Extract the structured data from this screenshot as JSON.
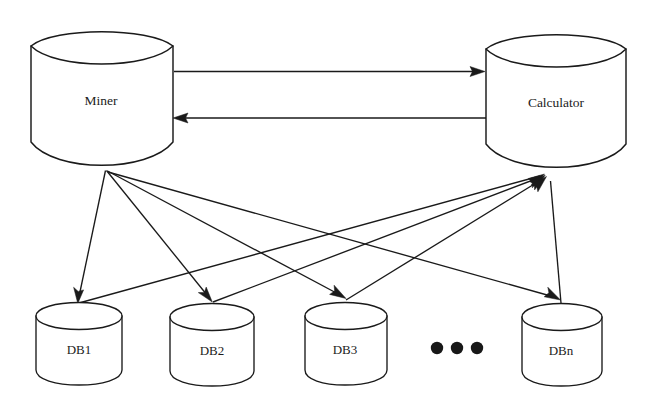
{
  "diagram": {
    "background_color": "#ffffff",
    "stroke_color": "#1a1a1a",
    "nodes": {
      "miner": {
        "label": "Miner",
        "type": "cylinder",
        "icon": "database-cylinder-icon"
      },
      "calculator": {
        "label": "Calculator",
        "type": "cylinder",
        "icon": "database-cylinder-icon"
      },
      "databases": [
        {
          "label": "DB1",
          "type": "cylinder",
          "icon": "database-cylinder-icon"
        },
        {
          "label": "DB2",
          "type": "cylinder",
          "icon": "database-cylinder-icon"
        },
        {
          "label": "DB3",
          "type": "cylinder",
          "icon": "database-cylinder-icon"
        },
        {
          "label": "DBn",
          "type": "cylinder",
          "icon": "database-cylinder-icon"
        }
      ]
    },
    "ellipsis": {
      "label": "● ● ●",
      "dot_count": 3,
      "meaning": "more databases"
    },
    "edges": [
      {
        "from": "Miner",
        "to": "Calculator",
        "direction": "right",
        "style": "straight-horizontal"
      },
      {
        "from": "Calculator",
        "to": "Miner",
        "direction": "left",
        "style": "straight-horizontal"
      },
      {
        "from": "Miner",
        "to": "DB1",
        "direction": "down",
        "style": "straight-diagonal"
      },
      {
        "from": "Miner",
        "to": "DB2",
        "direction": "down",
        "style": "straight-diagonal"
      },
      {
        "from": "Miner",
        "to": "DB3",
        "direction": "down",
        "style": "straight-diagonal"
      },
      {
        "from": "Miner",
        "to": "DBn",
        "direction": "down",
        "style": "straight-diagonal"
      },
      {
        "from": "DB1",
        "to": "Calculator",
        "direction": "up",
        "style": "straight-diagonal"
      },
      {
        "from": "DB2",
        "to": "Calculator",
        "direction": "up",
        "style": "straight-diagonal"
      },
      {
        "from": "DB3",
        "to": "Calculator",
        "direction": "up",
        "style": "straight-diagonal"
      },
      {
        "from": "DBn",
        "to": "Calculator",
        "direction": "up",
        "style": "straight-diagonal"
      }
    ]
  }
}
